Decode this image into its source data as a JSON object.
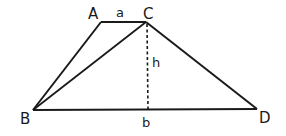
{
  "diagram": {
    "vertices": {
      "A": {
        "label": "A",
        "x": 101,
        "y": 22
      },
      "C": {
        "label": "C",
        "x": 146,
        "y": 22
      },
      "B": {
        "label": "B",
        "x": 33,
        "y": 110
      },
      "D": {
        "label": "D",
        "x": 257,
        "y": 109
      }
    },
    "labels": {
      "A": "A",
      "a": "a",
      "C": "C",
      "h": "h",
      "B": "B",
      "b": "b",
      "D": "D"
    },
    "segments": [
      {
        "from": "A",
        "to": "C",
        "style": "solid",
        "measure": "a"
      },
      {
        "from": "A",
        "to": "B",
        "style": "solid"
      },
      {
        "from": "C",
        "to": "B",
        "style": "solid"
      },
      {
        "from": "C",
        "to": "D",
        "style": "solid"
      },
      {
        "from": "B",
        "to": "D",
        "style": "solid",
        "measure": "b"
      },
      {
        "from": "C",
        "to": "foot",
        "style": "dashed",
        "measure": "h"
      }
    ],
    "colors": {
      "stroke": "#1a1a1a",
      "background": "#ffffff"
    }
  }
}
